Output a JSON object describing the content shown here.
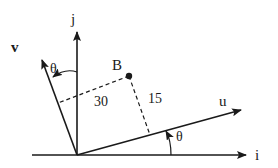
{
  "diagram": {
    "type": "coordinate-rotation",
    "colors": {
      "ink": "#1a1a1a",
      "background": "#ffffff"
    },
    "axes": {
      "i": {
        "label": "i"
      },
      "j": {
        "label": "j"
      },
      "u": {
        "label": "u"
      },
      "v": {
        "label": "v"
      }
    },
    "point": {
      "label": "B"
    },
    "distances": {
      "to_u_axis": "15",
      "to_v_axis": "30"
    },
    "angles": {
      "theta_top": "θ",
      "theta_bottom": "θ"
    }
  }
}
